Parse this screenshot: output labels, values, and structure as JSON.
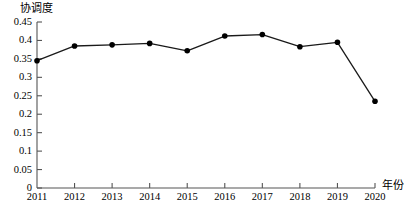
{
  "chart_data": {
    "type": "line",
    "title": "",
    "xlabel": "年份",
    "ylabel": "协调度",
    "categories": [
      "2011",
      "2012",
      "2013",
      "2014",
      "2015",
      "2016",
      "2017",
      "2018",
      "2019",
      "2020"
    ],
    "values": [
      0.345,
      0.385,
      0.388,
      0.392,
      0.372,
      0.412,
      0.416,
      0.383,
      0.395,
      0.235
    ],
    "series": [
      {
        "name": "协调度",
        "values": [
          0.345,
          0.385,
          0.388,
          0.392,
          0.372,
          0.412,
          0.416,
          0.383,
          0.395,
          0.235
        ]
      }
    ],
    "ylim": [
      0,
      0.45
    ],
    "yticks": [
      "0",
      "0.05",
      "0.1",
      "0.15",
      "0.2",
      "0.25",
      "0.3",
      "0.35",
      "0.4",
      "0.45"
    ],
    "ytick_values": [
      0,
      0.05,
      0.1,
      0.15,
      0.2,
      0.25,
      0.3,
      0.35,
      0.4,
      0.45
    ],
    "grid": false,
    "legend": "none",
    "marker": "filled-circle",
    "line_color": "#1a1a1a",
    "marker_color": "#000000",
    "axis_color": "#555555"
  },
  "axes": {
    "y_title": "协调度",
    "x_title": "年份"
  },
  "caption": {
    "text": ""
  }
}
